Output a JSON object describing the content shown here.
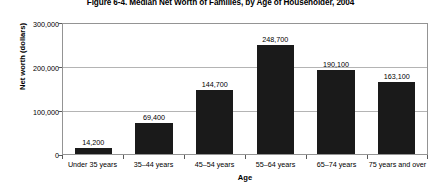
{
  "chart_data": {
    "type": "bar",
    "title": "Figure 6-4. Median Net Worth of Families, by Age of Householder, 2004",
    "xlabel": "Age",
    "ylabel": "Net worth (dollars)",
    "categories": [
      "Under 35 years",
      "35–44 years",
      "45–54 years",
      "55–64 years",
      "65–74 years",
      "75 years and over"
    ],
    "values": [
      14200,
      69400,
      144700,
      248700,
      190100,
      163100
    ],
    "value_labels": [
      "14,200",
      "69,400",
      "144,700",
      "248,700",
      "190,100",
      "163,100"
    ],
    "ylim": [
      0,
      300000
    ],
    "yticks": [
      0,
      100000,
      200000,
      300000
    ],
    "ytick_labels": [
      "0",
      "100,000",
      "200,000",
      "300,000"
    ],
    "grid": true,
    "legend": null,
    "bar_color": "#1a1a1a",
    "gridline_color": "#b4b4b4",
    "frame_color": "#949494"
  }
}
